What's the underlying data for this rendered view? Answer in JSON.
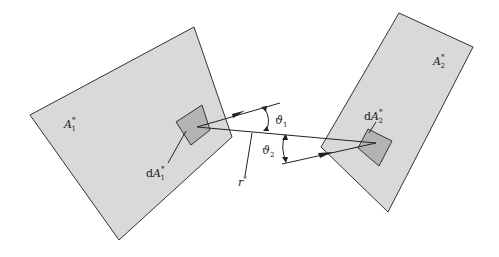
{
  "diagram": {
    "colors": {
      "surface_fill": "#d9d9d9",
      "element_fill": "#b3b3b3",
      "stroke": "#333333",
      "text": "#222222"
    },
    "surfaces": [
      {
        "id": "A1",
        "label": "A",
        "sub": "1",
        "sup": "*"
      },
      {
        "id": "A2",
        "label": "A",
        "sub": "2",
        "sup": "*"
      }
    ],
    "elements": [
      {
        "id": "dA1",
        "prefix": "d",
        "label": "A",
        "sub": "1",
        "sup": "*"
      },
      {
        "id": "dA2",
        "prefix": "d",
        "label": "A",
        "sub": "2",
        "sup": "*"
      }
    ],
    "distance": {
      "label": "r",
      "sup": "*"
    },
    "angles": [
      {
        "id": "theta1",
        "symbol": "ϑ",
        "sub": "1"
      },
      {
        "id": "theta2",
        "symbol": "ϑ",
        "sub": "2"
      }
    ]
  }
}
